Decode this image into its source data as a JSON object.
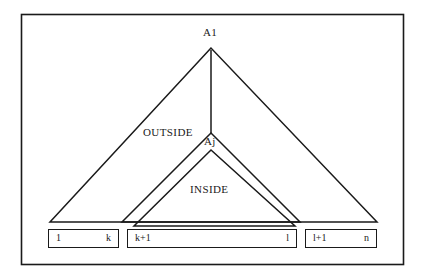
{
  "figure": {
    "type": "diagram",
    "kind": "nested-triangle-partition-diagram",
    "background_color": "#ffffff",
    "line_color": "#1a1a1a",
    "border": {
      "name": "figure-frame",
      "x": 21,
      "y": 14,
      "width": 383,
      "height": 251
    },
    "nodes": [
      {
        "id": "A1",
        "label": "A1",
        "x": 211,
        "y": 48
      },
      {
        "id": "Aj",
        "label": "Aj",
        "x": 211,
        "y": 133
      }
    ],
    "region_labels": [
      {
        "id": "outside",
        "label": "OUTSIDE"
      },
      {
        "id": "inside",
        "label": "INSIDE"
      }
    ],
    "triangles": [
      {
        "id": "outer-triangle",
        "apex": [
          211,
          48
        ],
        "base_left": [
          50,
          222
        ],
        "base_right": [
          377,
          222
        ]
      },
      {
        "id": "middle-triangle",
        "apex": [
          211,
          133
        ],
        "base_left": [
          122,
          222
        ],
        "base_right": [
          300,
          222
        ]
      },
      {
        "id": "inner-triangle",
        "apex": [
          211,
          150
        ],
        "base_left": [
          134,
          226
        ],
        "base_right": [
          295,
          226
        ]
      }
    ],
    "connector": {
      "id": "apex-connector-line",
      "from": [
        211,
        48
      ],
      "to": [
        211,
        133
      ]
    },
    "ranges": [
      {
        "id": "range-1-k",
        "start": "1",
        "end": "k"
      },
      {
        "id": "range-k1-l",
        "start": "k+1",
        "end": "l"
      },
      {
        "id": "range-l1-n",
        "start": "l+1",
        "end": "n"
      }
    ]
  }
}
